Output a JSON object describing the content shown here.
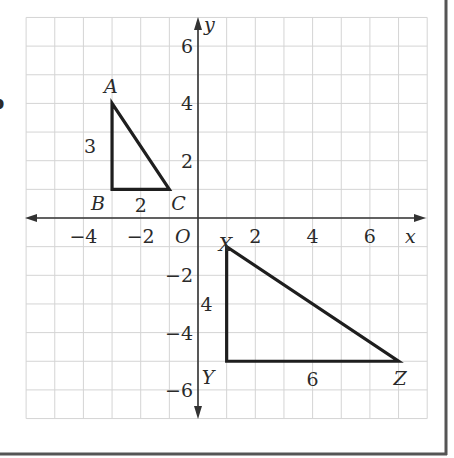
{
  "figure": {
    "partial_left_label": "b",
    "colors": {
      "grid": "#d4d4d4",
      "axis": "#333333",
      "shape": "#1e1e1e",
      "frame": "#555555",
      "text": "#2a2a2a"
    },
    "grid": {
      "origin_px": [
        198,
        218
      ],
      "unit_px": 28.65,
      "x_range": [
        -6,
        8
      ],
      "y_range": [
        -7,
        7
      ]
    },
    "axes": {
      "x_label": "x",
      "y_label": "y",
      "origin_label": "O",
      "x_ticks": [
        {
          "value": -4,
          "label": "−4"
        },
        {
          "value": -2,
          "label": "−2"
        },
        {
          "value": 2,
          "label": "2"
        },
        {
          "value": 4,
          "label": "4"
        },
        {
          "value": 6,
          "label": "6"
        }
      ],
      "y_ticks": [
        {
          "value": 6,
          "label": "6"
        },
        {
          "value": 4,
          "label": "4"
        },
        {
          "value": 2,
          "label": "2"
        },
        {
          "value": -2,
          "label": "−2"
        },
        {
          "value": -4,
          "label": "−4"
        },
        {
          "value": -6,
          "label": "−6"
        }
      ]
    },
    "triangles": [
      {
        "name": "ABC",
        "vertices": [
          {
            "label": "A",
            "x": -3,
            "y": 4
          },
          {
            "label": "B",
            "x": -3,
            "y": 1
          },
          {
            "label": "C",
            "x": -1,
            "y": 1
          }
        ],
        "side_labels": [
          {
            "text": "3",
            "side": "AB"
          },
          {
            "text": "2",
            "side": "BC"
          }
        ]
      },
      {
        "name": "XYZ",
        "vertices": [
          {
            "label": "X",
            "x": 1,
            "y": -1
          },
          {
            "label": "Y",
            "x": 1,
            "y": -5
          },
          {
            "label": "Z",
            "x": 7,
            "y": -5
          }
        ],
        "side_labels": [
          {
            "text": "4",
            "side": "XY"
          },
          {
            "text": "6",
            "side": "YZ"
          }
        ]
      }
    ]
  }
}
